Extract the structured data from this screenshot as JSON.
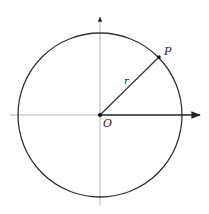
{
  "diagram": {
    "type": "unit-circle-polar",
    "labels": {
      "point": "P",
      "radius": "r",
      "origin": "O"
    },
    "geometry": {
      "center": [
        100,
        115
      ],
      "radius": 82,
      "point_P": [
        159,
        58
      ]
    },
    "colors": {
      "circle": "#333333",
      "axis": "#999999",
      "ray": "#222222"
    }
  }
}
